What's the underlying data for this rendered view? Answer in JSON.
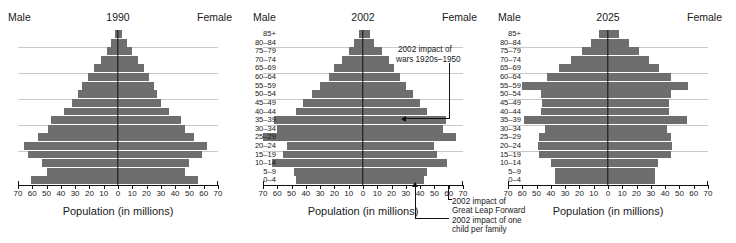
{
  "figure": {
    "axis_title": "Population (in millions)",
    "male_label": "Male",
    "female_label": "Female",
    "age_groups": [
      "85+",
      "80–84",
      "75–79",
      "70–74",
      "65–69",
      "60–64",
      "55–59",
      "50–54",
      "45–49",
      "40–44",
      "35–39",
      "30–34",
      "25–29",
      "20–24",
      "15–19",
      "10–14",
      "5–9",
      "0–4"
    ],
    "x_ticks": [
      "70",
      "60",
      "50",
      "40",
      "30",
      "20",
      "10",
      "0",
      "10",
      "20",
      "30",
      "40",
      "50",
      "60",
      "70"
    ]
  },
  "annotations": {
    "wars": "2002 impact of\nwars 1920s–1950",
    "wars_line1": "2002 impact of",
    "wars_line2": "wars 1920s–1950",
    "glf_line1": "2002 impact of",
    "glf_line2": "Great Leap Forward",
    "onechild_line1": "2002 impact of one",
    "onechild_line2": "child per family"
  },
  "chart_data": [
    {
      "type": "bar",
      "title": "1990",
      "subtitle": "Population pyramid of China, 1990",
      "xlabel": "Population (in millions)",
      "ylabel": "",
      "xlim": [
        -70,
        70
      ],
      "grid": true,
      "legend": [
        "Male",
        "Female"
      ],
      "categories": [
        "85+",
        "80–84",
        "75–79",
        "70–74",
        "65–69",
        "60–64",
        "55–59",
        "50–54",
        "45–49",
        "40–44",
        "35–39",
        "30–34",
        "25–29",
        "20–24",
        "15–19",
        "10–14",
        "5–9",
        "0–4"
      ],
      "series": [
        {
          "name": "Male",
          "values": [
            2,
            5,
            8,
            12,
            17,
            21,
            25,
            28,
            32,
            38,
            47,
            49,
            56,
            66,
            63,
            53,
            50,
            61
          ]
        },
        {
          "name": "Female",
          "values": [
            3,
            6,
            10,
            14,
            18,
            22,
            25,
            27,
            30,
            36,
            44,
            47,
            53,
            62,
            59,
            50,
            47,
            56
          ]
        }
      ]
    },
    {
      "type": "bar",
      "title": "2002",
      "subtitle": "Population pyramid of China, 2002",
      "xlabel": "Population (in millions)",
      "ylabel": "",
      "xlim": [
        -70,
        70
      ],
      "grid": true,
      "legend": [
        "Male",
        "Female"
      ],
      "categories": [
        "85+",
        "80–84",
        "75–79",
        "70–74",
        "65–69",
        "60–64",
        "55–59",
        "50–54",
        "45–49",
        "40–44",
        "35–39",
        "30–34",
        "25–29",
        "20–24",
        "15–19",
        "10–14",
        "5–9",
        "0–4"
      ],
      "series": [
        {
          "name": "Male",
          "values": [
            3,
            6,
            10,
            15,
            20,
            24,
            30,
            36,
            42,
            47,
            62,
            60,
            70,
            53,
            56,
            64,
            48,
            47
          ]
        },
        {
          "name": "Female",
          "values": [
            5,
            8,
            13,
            18,
            22,
            26,
            30,
            35,
            40,
            45,
            58,
            56,
            65,
            50,
            52,
            59,
            45,
            43
          ]
        }
      ]
    },
    {
      "type": "bar",
      "title": "2025",
      "subtitle": "Population pyramid of China, 2025",
      "xlabel": "Population (in millions)",
      "ylabel": "",
      "xlim": [
        -70,
        70
      ],
      "grid": true,
      "legend": [
        "Male",
        "Female"
      ],
      "categories": [
        "85+",
        "80–84",
        "75–79",
        "70–74",
        "65–69",
        "60–64",
        "55–59",
        "50–54",
        "45–49",
        "40–44",
        "35–39",
        "30–34",
        "25–29",
        "20–24",
        "15–19",
        "10–14",
        "5–9",
        "0–4"
      ],
      "series": [
        {
          "name": "Male",
          "values": [
            6,
            12,
            18,
            26,
            34,
            43,
            60,
            47,
            46,
            47,
            59,
            44,
            48,
            49,
            48,
            40,
            37,
            37
          ]
        },
        {
          "name": "Female",
          "values": [
            8,
            15,
            22,
            29,
            36,
            44,
            56,
            44,
            43,
            43,
            55,
            41,
            44,
            45,
            44,
            35,
            33,
            33
          ]
        }
      ]
    }
  ]
}
